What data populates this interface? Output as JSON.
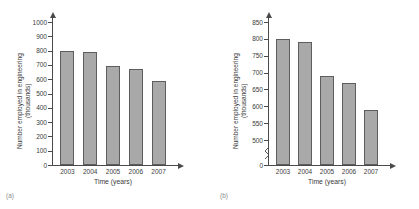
{
  "figure": {
    "cut_header_text": "",
    "panels": [
      {
        "caption": "(a)",
        "ylabel": "Number employed in engineering (thousands)",
        "xlabel": "Time (years)",
        "yticks": [
          "0",
          "100",
          "200",
          "300",
          "400",
          "500",
          "600",
          "700",
          "800",
          "900",
          "1000"
        ],
        "xticks": [
          "2003",
          "2004",
          "2005",
          "2006",
          "2007"
        ]
      },
      {
        "caption": "(b)",
        "ylabel": "Number employed in engineering (thousands)",
        "xlabel": "Time (years)",
        "yticks": [
          "0",
          "500",
          "550",
          "600",
          "650",
          "700",
          "750",
          "800",
          "850"
        ],
        "xticks": [
          "2003",
          "2004",
          "2005",
          "2006",
          "2007"
        ]
      }
    ]
  },
  "chart_data": [
    {
      "type": "bar",
      "panel": "(a)",
      "title": "",
      "categories": [
        "2003",
        "2004",
        "2005",
        "2006",
        "2007"
      ],
      "values": [
        800,
        790,
        690,
        670,
        590
      ],
      "xlabel": "Time (years)",
      "ylabel": "Number employed in engineering (thousands)",
      "ylim": [
        0,
        1000
      ],
      "ytick_step": 100,
      "axis_break": false,
      "grid": false,
      "legend": "none",
      "bar_color": "#a9a9a9",
      "bar_edge_color": "#5d5d5d"
    },
    {
      "type": "bar",
      "panel": "(b)",
      "title": "",
      "categories": [
        "2003",
        "2004",
        "2005",
        "2006",
        "2007"
      ],
      "values": [
        800,
        790,
        690,
        670,
        590
      ],
      "xlabel": "Time (years)",
      "ylabel": "Number employed in engineering (thousands)",
      "ylim": [
        500,
        850
      ],
      "ytick_step": 50,
      "axis_break": true,
      "axis_break_note": "zig-zag break between 0 and 500 on y-axis",
      "grid": false,
      "legend": "none",
      "bar_color": "#a9a9a9",
      "bar_edge_color": "#5d5d5d"
    }
  ]
}
